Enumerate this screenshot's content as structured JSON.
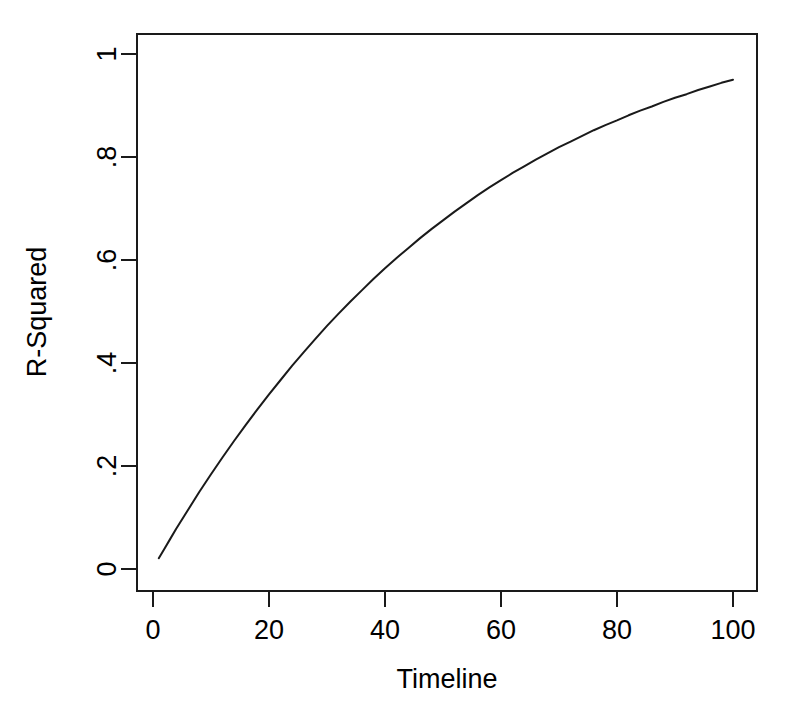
{
  "chart_data": {
    "type": "line",
    "title": "",
    "xlabel": "Timeline",
    "ylabel": "R-Squared",
    "xlim": [
      0,
      103
    ],
    "ylim": [
      -0.03,
      1.05
    ],
    "grid": false,
    "legend": false,
    "xticks": [
      0,
      20,
      40,
      60,
      80,
      100
    ],
    "xticklabels": [
      "0",
      "20",
      "40",
      "60",
      "80",
      "100"
    ],
    "yticks": [
      0,
      0.2,
      0.4,
      0.6,
      0.8,
      1
    ],
    "yticklabels": [
      "0",
      ".2",
      ".4",
      ".6",
      ".8",
      "1"
    ],
    "series": [
      {
        "name": "R-Squared",
        "x": [
          1,
          2,
          3,
          4,
          5,
          6,
          7,
          8,
          9,
          10,
          12,
          14,
          16,
          18,
          20,
          22,
          24,
          26,
          28,
          30,
          32,
          34,
          36,
          38,
          40,
          42,
          44,
          46,
          48,
          50,
          52,
          54,
          56,
          58,
          60,
          62,
          64,
          66,
          68,
          70,
          72,
          74,
          76,
          78,
          80,
          82,
          84,
          86,
          88,
          90,
          92,
          94,
          96,
          98,
          100
        ],
        "values": [
          0.021,
          0.04,
          0.059,
          0.078,
          0.096,
          0.114,
          0.132,
          0.15,
          0.167,
          0.184,
          0.217,
          0.249,
          0.28,
          0.31,
          0.339,
          0.367,
          0.395,
          0.421,
          0.447,
          0.472,
          0.496,
          0.519,
          0.541,
          0.563,
          0.584,
          0.604,
          0.623,
          0.642,
          0.66,
          0.677,
          0.694,
          0.71,
          0.726,
          0.741,
          0.755,
          0.769,
          0.782,
          0.795,
          0.807,
          0.819,
          0.83,
          0.841,
          0.852,
          0.862,
          0.871,
          0.881,
          0.89,
          0.898,
          0.907,
          0.915,
          0.922,
          0.93,
          0.937,
          0.944,
          0.95
        ]
      }
    ],
    "plot_box": {
      "left": 137,
      "right": 757,
      "top": 34,
      "bottom": 591
    },
    "colors": {
      "background": "#ffffff",
      "line": "#1a1a1a",
      "axis": "#1a1a1a",
      "text": "#000000"
    }
  }
}
